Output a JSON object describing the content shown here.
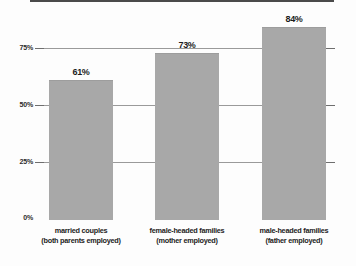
{
  "chart_data": {
    "type": "bar",
    "title": "",
    "subtitle": "",
    "xlabel": "",
    "ylabel": "",
    "ylim": [
      0,
      100
    ],
    "grid": true,
    "legend": false,
    "orientation": "vertical",
    "bar_color": "#a8a8a8",
    "background_color": "#fdfdfd",
    "axis_color": "#4a4a4a",
    "gridline_color": "#9a9a9a",
    "categories": [
      "married couples (both parents employed)",
      "female-headed families (mother employed)",
      "male-headed families (father employed)"
    ],
    "category_lines": [
      {
        "line1": "married couples",
        "line2": "(both parents employed)"
      },
      {
        "line1": "female-headed families",
        "line2": "(mother employed)"
      },
      {
        "line1": "male-headed families",
        "line2": "(father employed)"
      }
    ],
    "values": [
      61,
      73,
      84
    ],
    "value_labels": [
      "61%",
      "73%",
      "84%"
    ],
    "yticks": [
      0,
      25,
      50,
      75
    ],
    "ytick_labels": [
      "0%",
      "25%",
      "50%",
      "75%"
    ]
  }
}
